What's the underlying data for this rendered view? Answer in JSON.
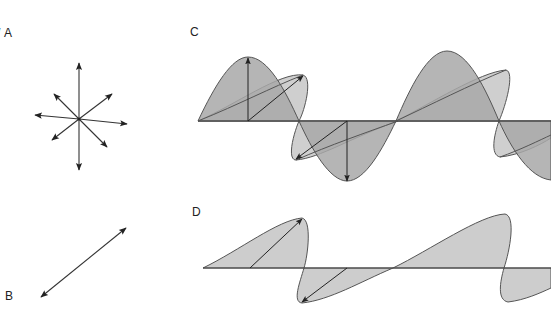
{
  "figure": {
    "colors": {
      "ink": "#2a2a2a",
      "fill_dark": "#a9a9a9",
      "fill_light": "#c9c9c9",
      "background": "#ffffff"
    }
  },
  "panels": {
    "a": {
      "label": "A",
      "stray_prefix": "/",
      "content": "unpolarized: vectors in all directions"
    },
    "b": {
      "label": "B",
      "content": "single plane-polarized vector"
    },
    "c": {
      "label": "C",
      "content": "unpolarized wave: vertical and diagonal components"
    },
    "d": {
      "label": "D",
      "content": "plane-polarized wave: diagonal component only"
    }
  }
}
